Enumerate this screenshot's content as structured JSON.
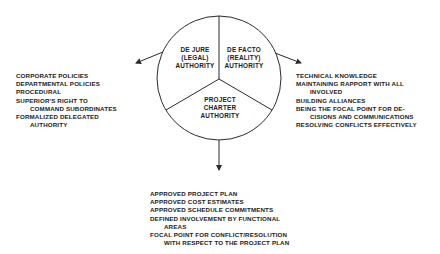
{
  "diagram": {
    "segments": [
      {
        "id": "de-jure",
        "lines": [
          "DE JURE",
          "(LEGAL)",
          "AUTHORITY"
        ]
      },
      {
        "id": "de-facto",
        "lines": [
          "DE FACTO",
          "(REALITY)",
          "AUTHORITY"
        ]
      },
      {
        "id": "project-charter",
        "lines": [
          "PROJECT",
          "CHARTER",
          "AUTHORITY"
        ]
      }
    ],
    "left_list": {
      "items": [
        {
          "text": "CORPORATE POLICIES"
        },
        {
          "text": "DEPARTMENTAL POLICIES"
        },
        {
          "text": "PROCEDURAL"
        },
        {
          "text": "SUPERIOR'S RIGHT TO",
          "cont": "COMMAND SUBORDINATES"
        },
        {
          "text": "FORMALIZED DELEGATED",
          "cont": "AUTHORITY"
        }
      ]
    },
    "right_list": {
      "items": [
        {
          "text": "TECHNICAL KNOWLEDGE"
        },
        {
          "text": "MAINTAINING RAPPORT WITH ALL",
          "cont": "INVOLVED"
        },
        {
          "text": "BUILDING ALLIANCES"
        },
        {
          "text": "BEING THE FOCAL POINT FOR DE-",
          "cont": "CISIONS AND COMMUNICATIONS"
        },
        {
          "text": "RESOLVING CONFLICTS EFFECTIVELY"
        }
      ]
    },
    "bottom_list": {
      "items": [
        {
          "text": "APPROVED PROJECT PLAN"
        },
        {
          "text": "APPROVED COST ESTIMATES"
        },
        {
          "text": "APPROVED SCHEDULE COMMITMENTS"
        },
        {
          "text": "DEFINED INVOLVEMENT BY FUNCTIONAL",
          "cont": "AREAS"
        },
        {
          "text": "FOCAL POINT FOR CONFLICT/RESOLUTION",
          "cont": "WITH RESPECT TO THE PROJECT PLAN"
        }
      ]
    },
    "colors": {
      "line": "#2a2a2a",
      "text": "#1a1a1a",
      "background": "#ffffff"
    }
  }
}
